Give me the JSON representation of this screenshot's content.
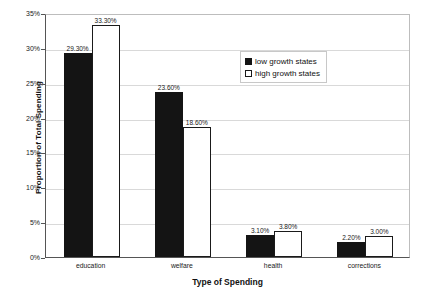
{
  "chart_data": {
    "type": "bar",
    "title": "",
    "xlabel": "Type of Spending",
    "ylabel": "Proportion of Total Spending",
    "categories": [
      "education",
      "welfare",
      "health",
      "corrections"
    ],
    "series": [
      {
        "name": "low growth states",
        "color": "#141414",
        "values": [
          29.3,
          23.6,
          3.1,
          2.2
        ],
        "labels": [
          "29.30%",
          "23.60%",
          "3.10%",
          "2.20%"
        ]
      },
      {
        "name": "high growth states",
        "color": "#ffffff",
        "values": [
          33.3,
          18.6,
          3.8,
          3.0
        ],
        "labels": [
          "33.30%",
          "18.60%",
          "3.80%",
          "3.00%"
        ]
      }
    ],
    "ylim": [
      0,
      35
    ],
    "yticks": [
      0,
      5,
      10,
      15,
      20,
      25,
      30,
      35
    ],
    "ytick_labels": [
      "0%",
      "5%",
      "10%",
      "15%",
      "20%",
      "25%",
      "30%",
      "35%"
    ],
    "grid": true,
    "legend_position": "top-center-right"
  },
  "legend": {
    "entries": [
      {
        "label": "low growth states",
        "swatch": "filled-black-square"
      },
      {
        "label": "high growth states",
        "swatch": "outlined-white-square"
      }
    ]
  },
  "axes": {
    "y_title": "Proportion of Total Spending",
    "x_title": "Type of Spending"
  }
}
